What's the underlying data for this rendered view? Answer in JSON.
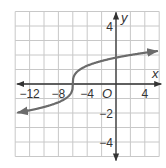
{
  "chart_data": {
    "type": "line",
    "title": "",
    "function": "y = cbrt(x + 6)",
    "xlabel": "x",
    "ylabel": "y",
    "origin_label": "O",
    "xlim": [
      -14,
      6
    ],
    "ylim": [
      -5,
      5
    ],
    "grid": true,
    "x_grid_step": 2,
    "y_grid_step": 1,
    "x_ticks": [
      {
        "value": -12,
        "label": "−12"
      },
      {
        "value": -8,
        "label": "−8"
      },
      {
        "value": -4,
        "label": "−4"
      },
      {
        "value": 4,
        "label": "4"
      }
    ],
    "y_ticks": [
      {
        "value": 4,
        "label": "4"
      },
      {
        "value": -2,
        "label": "−2"
      },
      {
        "value": -4,
        "label": "−4"
      }
    ],
    "series": [
      {
        "name": "curve",
        "x": [
          -13.6,
          -13,
          -11,
          -9,
          -7,
          -6.5,
          -6,
          -5.5,
          -5,
          -3,
          -1,
          1,
          3,
          5.7
        ],
        "y": [
          -1.97,
          -1.91,
          -1.71,
          -1.44,
          -1.0,
          -0.79,
          0,
          0.79,
          1.0,
          1.44,
          1.71,
          1.91,
          2.08,
          2.27
        ],
        "arrows": "both"
      }
    ],
    "inflection_point": {
      "x": -6,
      "y": 0
    },
    "colors": {
      "curve": "#6b6b6b",
      "axes": "#333333",
      "grid": "#c8c8c8"
    }
  }
}
